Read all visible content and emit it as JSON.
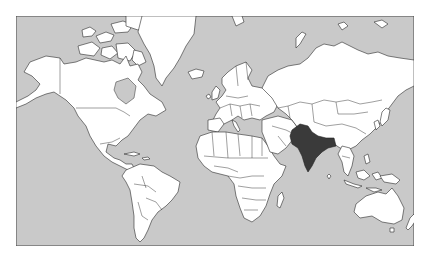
{
  "map": {
    "projection": "Mercator",
    "title": "World map with India highlighted",
    "colors": {
      "ocean": "#c9c9c9",
      "land": "#ffffff",
      "outline": "#2a2a2a",
      "highlight": "#3a3a3a",
      "frame": "#444444"
    },
    "highlighted_countries": [
      "India"
    ]
  }
}
